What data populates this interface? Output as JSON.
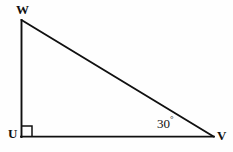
{
  "figure": {
    "type": "geometry-diagram",
    "shape": "right-triangle",
    "background_color": "#fefefe",
    "stroke_color": "#101010",
    "width": 233,
    "height": 152
  },
  "vertices": {
    "w": {
      "label": "W",
      "x": 21,
      "y": 20
    },
    "u": {
      "label": "U",
      "x": 21,
      "y": 137
    },
    "v": {
      "label": "V",
      "x": 213,
      "y": 137
    }
  },
  "angles": {
    "at_v": {
      "value": "30",
      "symbol": "°",
      "text": "30°"
    },
    "at_u": {
      "value": "90",
      "symbol": "°",
      "text": "90°",
      "marker": "right-angle-square"
    }
  },
  "sides": [
    {
      "name": "leg-uw",
      "from": "U",
      "to": "W",
      "orientation": "vertical"
    },
    {
      "name": "leg-uv",
      "from": "U",
      "to": "V",
      "orientation": "horizontal"
    },
    {
      "name": "hypotenuse-wv",
      "from": "W",
      "to": "V",
      "orientation": "diagonal"
    }
  ]
}
